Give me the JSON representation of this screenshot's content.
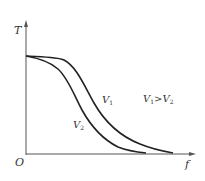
{
  "diagram": {
    "axes": {
      "y_label": "T",
      "x_label": "f",
      "origin_label": "O"
    },
    "curves": [
      {
        "name": "V1",
        "label_main": "V",
        "label_sub": "1",
        "shape": "high plateau, later decline toward zero"
      },
      {
        "name": "V2",
        "label_main": "V",
        "label_sub": "2",
        "shape": "high plateau, earlier decline toward zero"
      }
    ],
    "annotation": {
      "a_main": "V",
      "a_sub": "1",
      "op": ">",
      "b_main": "V",
      "b_sub": "2"
    },
    "colors": {
      "axis": "#555555",
      "curve": "#222222"
    }
  }
}
